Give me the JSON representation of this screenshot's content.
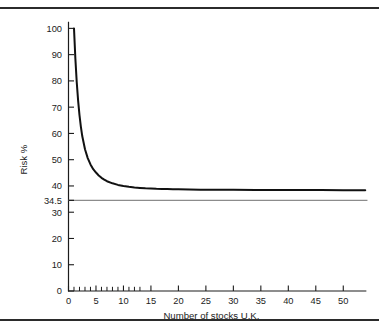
{
  "figure": {
    "top_rule": "",
    "bottom_rule": ""
  },
  "chart_data": {
    "type": "line",
    "title": "",
    "xlabel": "Number of stocks U.K.",
    "ylabel": "Risk %",
    "xlim": [
      0,
      54.5
    ],
    "ylim": [
      0,
      103
    ],
    "grid": false,
    "legend": false,
    "x_ticks": [
      0,
      5,
      10,
      15,
      20,
      25,
      30,
      35,
      40,
      45,
      50
    ],
    "x_tick_labels": [
      "0",
      "5",
      "10",
      "15",
      "20",
      "25",
      "30",
      "35",
      "40",
      "45",
      "50"
    ],
    "x_minor_ticks": [
      1,
      2,
      3,
      4,
      6,
      7,
      8,
      9,
      11,
      12,
      13
    ],
    "y_ticks": [
      0,
      10,
      20,
      30,
      34.5,
      40,
      50,
      60,
      70,
      80,
      90,
      100
    ],
    "y_tick_labels": [
      "0",
      "10",
      "20",
      "30",
      "34.5",
      "40",
      "50",
      "60",
      "70",
      "80",
      "90",
      "100"
    ],
    "series": [
      {
        "name": "Portfolio risk",
        "color": "#111111",
        "style": "solid",
        "width": 2.0,
        "x": [
          1,
          1.25,
          1.5,
          1.75,
          2,
          2.25,
          2.5,
          3,
          3.5,
          4,
          4.5,
          5,
          5.5,
          6,
          6.5,
          7,
          8,
          9,
          10,
          11,
          12,
          13,
          14,
          15,
          16,
          17,
          18,
          19,
          20,
          22,
          24,
          26,
          28,
          30,
          34,
          38,
          42,
          46,
          50,
          54
        ],
        "y": [
          100,
          88.5,
          79.5,
          72.5,
          67.0,
          62.6,
          59.0,
          54.0,
          50.6,
          48.2,
          46.4,
          45.1,
          44.0,
          43.1,
          42.4,
          41.8,
          41.0,
          40.4,
          40.0,
          39.7,
          39.45,
          39.25,
          39.1,
          39.0,
          38.9,
          38.85,
          38.8,
          38.75,
          38.7,
          38.65,
          38.6,
          38.58,
          38.56,
          38.55,
          38.5,
          38.48,
          38.45,
          38.42,
          38.4,
          38.38
        ]
      }
    ],
    "reference_lines": [
      {
        "name": "market-risk-level",
        "orientation": "horizontal",
        "value": 34.5,
        "label": "34.5",
        "color": "#8c8c8c",
        "width": 1.4
      }
    ]
  }
}
